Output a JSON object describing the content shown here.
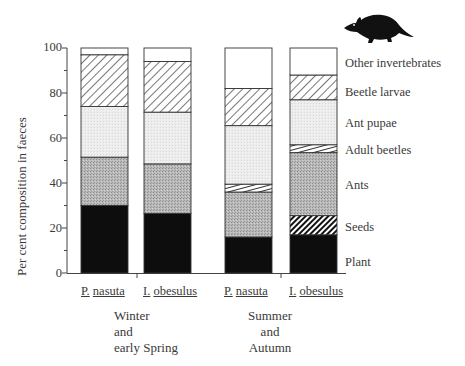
{
  "chart_data": {
    "type": "bar",
    "stacked": true,
    "title": "",
    "xlabel": "",
    "ylabel": "Per cent composition in faeces",
    "ylim": [
      0,
      100
    ],
    "yticks": [
      0,
      20,
      40,
      60,
      80,
      100
    ],
    "grid": false,
    "legend_position": "right (labels aligned with final bar segments)",
    "categories": [
      "P. nasuta",
      "I. obesulus",
      "P. nasuta",
      "I. obesulus"
    ],
    "groups": [
      {
        "label": "Winter and early Spring",
        "lines": [
          "Winter",
          "and",
          "early Spring"
        ],
        "categories": [
          0,
          1
        ]
      },
      {
        "label": "Summer and Autumn",
        "lines": [
          "Summer",
          "and",
          "Autumn"
        ],
        "categories": [
          2,
          3
        ]
      }
    ],
    "series": [
      {
        "name": "Plant",
        "pattern": "solid-black",
        "values": [
          30,
          26.5,
          16,
          17
        ]
      },
      {
        "name": "Seeds",
        "pattern": "dense-diagonal-hatch",
        "values": [
          0,
          0,
          0,
          8.5
        ]
      },
      {
        "name": "Ants",
        "pattern": "medium-grey-stipple",
        "values": [
          21.5,
          22,
          20,
          28
        ]
      },
      {
        "name": "Adult beetles",
        "pattern": "shallow-diagonal-hatch",
        "values": [
          0,
          0,
          3.5,
          3.5
        ]
      },
      {
        "name": "Ant pupae",
        "pattern": "light-grey-stipple",
        "values": [
          22.5,
          23,
          26,
          20
        ]
      },
      {
        "name": "Beetle larvae",
        "pattern": "sparse-diagonal-hatch",
        "values": [
          23,
          22.5,
          16.5,
          11
        ]
      },
      {
        "name": "Other invertebrates",
        "pattern": "white",
        "values": [
          3,
          6,
          18,
          12
        ]
      }
    ]
  },
  "axis": {
    "ylabel": "Per cent composition in faeces",
    "ticks": [
      "0",
      "20",
      "40",
      "60",
      "80",
      "100"
    ]
  },
  "bars": [
    {
      "genus": "P.",
      "species": "nasuta"
    },
    {
      "genus": "I.",
      "species": "obesulus"
    },
    {
      "genus": "P.",
      "species": "nasuta"
    },
    {
      "genus": "I.",
      "species": "obesulus"
    }
  ],
  "groups": [
    {
      "lines": [
        "Winter",
        "and",
        "early Spring"
      ]
    },
    {
      "lines": [
        "Summer",
        "and",
        "Autumn"
      ]
    }
  ],
  "legend": [
    "Other invertebrates",
    "Beetle larvae",
    "Ant pupae",
    "Adult beetles",
    "Ants",
    "Seeds",
    "Plant"
  ],
  "icon": "bandicoot-silhouette-icon"
}
